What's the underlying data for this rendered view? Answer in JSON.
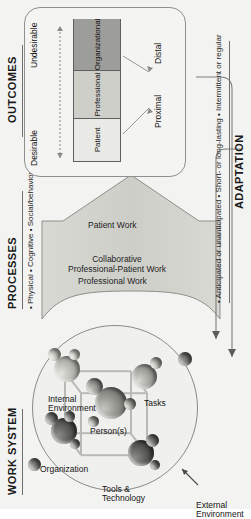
{
  "figure": {
    "background_color": "#f3f3f1"
  },
  "sections": {
    "work_system": {
      "heading": "WORK SYSTEM",
      "external_environment_label": "External\nEnvironment",
      "external_environment_line1": "External",
      "external_environment_line2": "Environment",
      "components": [
        {
          "id": "organization",
          "label": "Organization"
        },
        {
          "id": "tools-technology",
          "label_line1": "Tools &",
          "label_line2": "Technology",
          "label": "Tools & Technology"
        },
        {
          "id": "persons",
          "label": "Person(s)"
        },
        {
          "id": "internal-environment",
          "label_line1": "Internal",
          "label_line2": "Environment",
          "label": "Internal Environment"
        },
        {
          "id": "tasks",
          "label": "Tasks"
        }
      ]
    },
    "processes": {
      "heading": "PROCESSES",
      "bullets": "• Physical  • Cognitive  • Social/behavioural",
      "bullet_items": [
        "Physical",
        "Cognitive",
        "Social/behavioural"
      ],
      "arrow_labels": [
        {
          "id": "professional-work",
          "label": "Professional Work"
        },
        {
          "id": "collaborative-work",
          "label_line1": "Collaborative",
          "label_line2": "Professional-Patient Work",
          "label": "Collaborative Professional-Patient Work"
        },
        {
          "id": "patient-work",
          "label": "Patient Work"
        }
      ]
    },
    "outcomes": {
      "heading": "OUTCOMES",
      "segments": [
        {
          "id": "patient",
          "label": "Patient",
          "color": "#e9e9e5"
        },
        {
          "id": "professional",
          "label": "Professional",
          "color": "#cfcfca"
        },
        {
          "id": "organizational",
          "label": "Organizational",
          "color": "#9d9d99"
        }
      ],
      "axis_left_label": "Desirable",
      "axis_right_label": "Undesirable",
      "callout_distal": "Distal",
      "callout_proximal": "Proximal"
    },
    "adaptation": {
      "heading": "ADAPTATION",
      "bullets": "• Anticipated or unanticipated  • Short- or long-lasting  • Intermittent or regular",
      "bullet_items": [
        "Anticipated or unanticipated",
        "Short- or long-lasting",
        "Intermittent or regular"
      ]
    }
  }
}
